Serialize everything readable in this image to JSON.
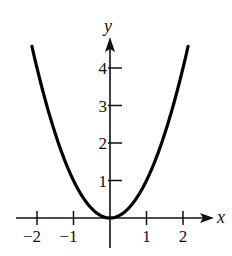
{
  "chart_data": {
    "type": "line",
    "title": "",
    "function": "y = x^2",
    "xlabel": "x",
    "ylabel": "y",
    "xlim": [
      -2.5,
      2.8
    ],
    "ylim": [
      0,
      4.8
    ],
    "x_ticks": [
      -2,
      -1,
      1,
      2
    ],
    "x_tick_labels": [
      "−2",
      "−1",
      "1",
      "2"
    ],
    "y_ticks": [
      1,
      2,
      3,
      4
    ],
    "y_tick_labels": [
      "1",
      "2",
      "3",
      "4"
    ],
    "grid": false,
    "legend": null,
    "series": [
      {
        "name": "y = x^2",
        "x": [
          -2.14,
          -2,
          -1.5,
          -1,
          -0.5,
          0,
          0.5,
          1,
          1.5,
          2,
          2.14
        ],
        "values": [
          4.58,
          4,
          2.25,
          1,
          0.25,
          0,
          0.25,
          1,
          2.25,
          4,
          4.58
        ],
        "color": "#000000"
      }
    ]
  }
}
